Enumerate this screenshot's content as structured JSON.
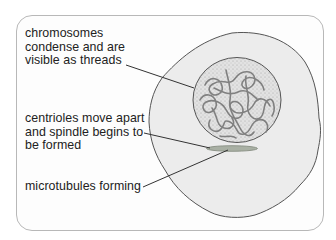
{
  "diagram": {
    "type": "cell-division-prophase",
    "labels": [
      {
        "id": "chromosomes",
        "text": "chromosomes\ncondense and are\nvisible as threads",
        "points_to": "nucleus-chromatin"
      },
      {
        "id": "centrioles",
        "text": "centrioles move apart\nand spindle begins to\nbe formed",
        "points_to": "spindle"
      },
      {
        "id": "microtubules",
        "text": "microtubules forming",
        "points_to": "spindle"
      }
    ],
    "colors": {
      "cell_fill": "#ececec",
      "cell_stroke": "#555555",
      "nucleus_fill": "#d9d9d9",
      "chromatin_stroke": "#7a7a7a",
      "spindle_fill": "#a9b0a4",
      "leader_line": "#333333",
      "frame_stroke": "#b8b8b8"
    }
  }
}
